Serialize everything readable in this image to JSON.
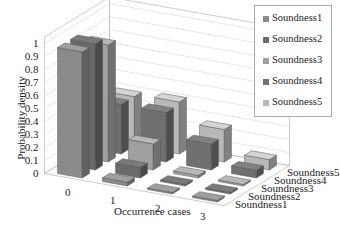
{
  "chart_data": {
    "type": "bar",
    "subtype": "3d-bar",
    "title": "",
    "xlabel": "Occurrence cases",
    "ylabel": "Probability density",
    "zlabel": "",
    "categories": [
      "0",
      "1",
      "2",
      "3"
    ],
    "yticks": [
      "0",
      "0.1",
      "0.2",
      "0.3",
      "0.4",
      "0.5",
      "0.6",
      "0.7",
      "0.8",
      "0.9",
      "1"
    ],
    "ylim": [
      0,
      1
    ],
    "grid": true,
    "legend_position": "top-right",
    "series": [
      {
        "name": "Soundness1",
        "color": "#8a8a8a",
        "values": [
          0.97,
          0.03,
          0.0,
          0.0
        ]
      },
      {
        "name": "Soundness2",
        "color": "#6a6a6a",
        "values": [
          0.97,
          0.08,
          0.01,
          0.0
        ]
      },
      {
        "name": "Soundness3",
        "color": "#a0a0a0",
        "values": [
          0.9,
          0.2,
          0.02,
          0.01
        ]
      },
      {
        "name": "Soundness4",
        "color": "#707070",
        "values": [
          0.38,
          0.38,
          0.2,
          0.06
        ]
      },
      {
        "name": "Soundness5",
        "color": "#b8b8b8",
        "values": [
          0.38,
          0.4,
          0.25,
          0.08
        ]
      }
    ]
  },
  "legend": {
    "items": [
      "Soundness1",
      "Soundness2",
      "Soundness3",
      "Soundness4",
      "Soundness5"
    ]
  },
  "axis": {
    "xlabel": "Occurrence cases",
    "ylabel": "Probability density",
    "xticks": [
      "0",
      "1",
      "2",
      "3"
    ],
    "zticks": [
      "Soundness1",
      "Soundness2",
      "Soundness3",
      "Soundness4",
      "Soundness5"
    ],
    "yticks": [
      "0",
      "0.1",
      "0.2",
      "0.3",
      "0.4",
      "0.5",
      "0.6",
      "0.7",
      "0.8",
      "0.9",
      "1"
    ]
  }
}
